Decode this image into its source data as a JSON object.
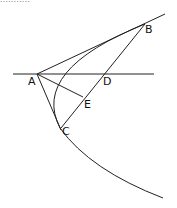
{
  "top_text": "...........",
  "points": {
    "A": {
      "label": "A",
      "x": 37,
      "y": 74
    },
    "B": {
      "label": "B",
      "x": 145,
      "y": 24
    },
    "C": {
      "label": "C",
      "x": 61,
      "y": 128
    },
    "D": {
      "label": "D",
      "x": 104,
      "y": 74
    },
    "E": {
      "label": "E",
      "x": 83,
      "y": 97
    }
  },
  "colors": {
    "stroke": "#222222",
    "background": "#ffffff"
  }
}
